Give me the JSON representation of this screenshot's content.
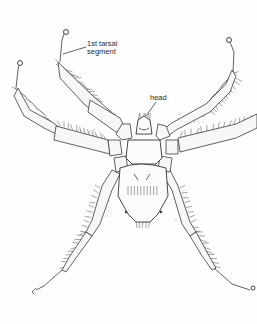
{
  "figure": {
    "labels": {
      "tarsal": [
        "1st tarsal",
        "segment"
      ],
      "head": "head"
    },
    "colors": {
      "ink": "#333333",
      "background": "#fefefe"
    }
  }
}
